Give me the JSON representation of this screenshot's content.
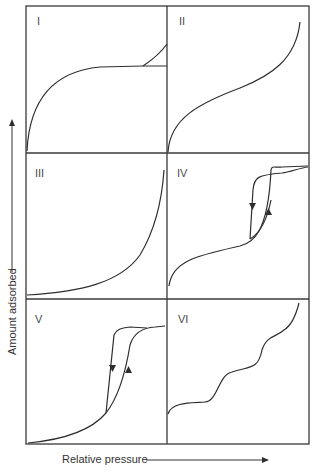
{
  "diagram": {
    "type": "adsorption-isotherm-classification",
    "x_axis_label": "Relative pressure",
    "y_axis_label": "Amount adsorbed",
    "panels": [
      {
        "id": "I",
        "label": "I",
        "shape": "monolayer plateau (Langmuir)"
      },
      {
        "id": "II",
        "label": "II",
        "shape": "sigmoid multilayer"
      },
      {
        "id": "III",
        "label": "III",
        "shape": "convex exponential rise"
      },
      {
        "id": "IV",
        "label": "IV",
        "shape": "sigmoid with hysteresis loop"
      },
      {
        "id": "V",
        "label": "V",
        "shape": "convex with hysteresis loop"
      },
      {
        "id": "VI",
        "label": "VI",
        "shape": "stepwise"
      }
    ]
  }
}
